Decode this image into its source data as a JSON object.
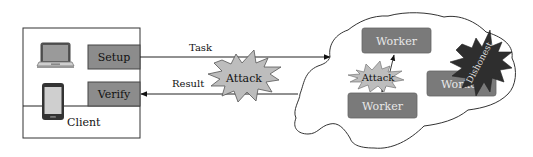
{
  "client": {
    "label": "Client",
    "devices": [
      "laptop-icon",
      "smartphone-icon"
    ],
    "buttons": [
      {
        "label": "Setup"
      },
      {
        "label": "Verify"
      }
    ]
  },
  "arrows": {
    "task": {
      "label": "Task",
      "direction": "client-to-cloud"
    },
    "result": {
      "label": "Result",
      "direction": "cloud-to-client"
    }
  },
  "attacks": {
    "channel": {
      "label": "Attack"
    },
    "internal": {
      "label": "Attack"
    }
  },
  "cloud": {
    "workers": [
      {
        "label": "Worker"
      },
      {
        "label": "Worker"
      },
      {
        "label": "Worker"
      }
    ],
    "dishonest": {
      "label": "Dishonest"
    }
  },
  "colors": {
    "box_fill": "#8c8c8c",
    "worker_fill": "#7a7a7a",
    "worker_text": "#e8e8e8",
    "attack_fill": "#bdbdbd",
    "dishonest_fill": "#2e2e2e",
    "line": "#222222"
  }
}
